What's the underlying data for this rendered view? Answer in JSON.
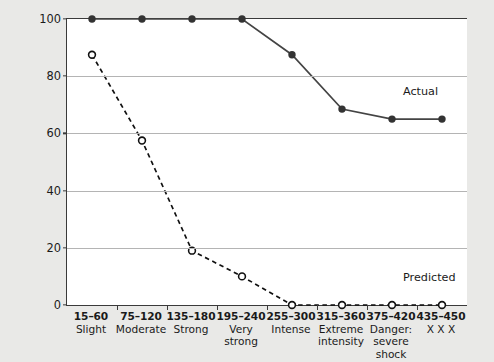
{
  "chart_data": {
    "type": "line",
    "title": "",
    "xlabel": "",
    "ylabel": "Percentage obeying experimenter at each level",
    "ylim": [
      0,
      100
    ],
    "yticks": [
      0,
      20,
      40,
      60,
      80,
      100
    ],
    "ytick_labels": [
      "0",
      "20",
      "40",
      "60",
      "80",
      "100"
    ],
    "grid": true,
    "legend_position": "inline-right",
    "categories": [
      "15-60 Slight",
      "75-120 Moderate",
      "135-180 Strong",
      "195-240 Very strong",
      "255-300 Intense",
      "315-360 Extreme intensity",
      "375-420 Danger: severe shock",
      "435-450 X X X"
    ],
    "category_ranges": [
      "15–60",
      "75–120",
      "135–180",
      "195–240",
      "255–300",
      "315–360",
      "375–420",
      "435–450"
    ],
    "category_descriptions": [
      "Slight",
      "Moderate",
      "Strong",
      "Very\nstrong",
      "Intense",
      "Extreme\nintensity",
      "Danger:\nsevere\nshock",
      "X X X"
    ],
    "series": [
      {
        "name": "Actual",
        "marker": "filled-circle",
        "linestyle": "solid",
        "color": "#444444",
        "values": [
          100,
          100,
          100,
          100,
          87.5,
          68.5,
          65,
          65
        ]
      },
      {
        "name": "Predicted",
        "marker": "open-circle",
        "linestyle": "dashed",
        "color": "#111111",
        "values": [
          87.5,
          57.5,
          19,
          10,
          0,
          0,
          0,
          0
        ]
      }
    ],
    "annotations": [
      {
        "text": "Actual",
        "category_index": 7,
        "value": 74
      },
      {
        "text": "Predicted",
        "category_index": 7,
        "value": 9
      }
    ]
  },
  "colors": {
    "figure_background": "#e9e9e7",
    "plot_background": "#ffffff",
    "axis": "#3a3a3a",
    "gridline": "#b4b4b4",
    "text": "#1a1a1a"
  }
}
